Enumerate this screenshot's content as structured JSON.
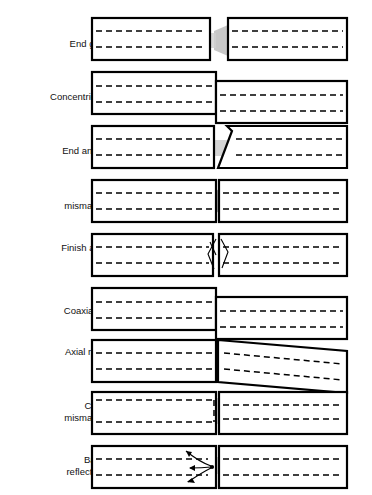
{
  "figure": {
    "background_color": "#ffffff",
    "outline_color": "#000000",
    "core_line_color": "#000000",
    "beam_color": "#b8b8b8",
    "beam_color_light": "#d8d8d8",
    "label_color": "#111111",
    "width": 372,
    "height": 495
  },
  "rows": [
    {
      "id": "end-gap",
      "label_lines": [
        "End gap"
      ],
      "label_text": "End gap",
      "label_y": 44,
      "top": 18,
      "bottom": 60,
      "description": "Two axially aligned fibres separated by a longitudinal air gap; light diverges across the gap."
    },
    {
      "id": "concentricity",
      "label_lines": [
        "Concentricity"
      ],
      "label_text": "Concentricity",
      "label_y": 97,
      "top": 72,
      "bottom": 114,
      "description": "Right fibre core offset vertically from left fibre core."
    },
    {
      "id": "end-angle",
      "label_lines": [
        "End angle"
      ],
      "label_text": "End angle",
      "label_y": 151,
      "top": 126,
      "bottom": 168,
      "description": "Right fibre end face cleaved at an angle rather than perpendicular."
    },
    {
      "id": "na-mismatch",
      "label_lines": [
        "NA",
        "mismatch"
      ],
      "label_text": "NA mismatch",
      "label_y": 200,
      "top": 180,
      "bottom": 222,
      "description": "Numerical aperture mismatch; light from left fibre over-fills acceptance cone of right fibre."
    },
    {
      "id": "finish-and-dirt",
      "label_lines": [
        "Finish and",
        "dirt"
      ],
      "label_text": "Finish and dirt",
      "label_y": 254,
      "top": 234,
      "bottom": 276,
      "description": "Surface roughness and contamination at the interface scatter the beam."
    },
    {
      "id": "coaxiality",
      "label_lines": [
        "Coaxiality"
      ],
      "label_text": "Coaxiality",
      "label_y": 311,
      "top": 288,
      "bottom": 330,
      "description": "Fibre axes laterally displaced; cladding outlines do not line up."
    },
    {
      "id": "axial-run-out",
      "label_lines": [
        "Axial run-",
        "out"
      ],
      "label_text": "Axial run-out",
      "label_y": 358,
      "top": 340,
      "bottom": 382,
      "description": "Right fibre tilted about the joint so its axis runs out at an angle."
    },
    {
      "id": "core-mismatch",
      "label_lines": [
        "Core",
        "mismatch"
      ],
      "label_text": "Core mismatch",
      "label_y": 412,
      "top": 392,
      "bottom": 434,
      "description": "Left fibre core diameter larger than right fibre core diameter."
    },
    {
      "id": "back-reflection",
      "label_lines": [
        "Back",
        "reflection"
      ],
      "label_text": "Back reflection",
      "label_y": 466,
      "top": 446,
      "bottom": 488,
      "description": "Part of the incident light is reflected back along the launching fibre."
    }
  ],
  "geometry": {
    "label_right_x": 105,
    "left_tube_x": 92,
    "left_tube_end_x": 216,
    "right_tube_start_x": 222,
    "right_tube_end_x": 347,
    "tube_height": 42
  }
}
